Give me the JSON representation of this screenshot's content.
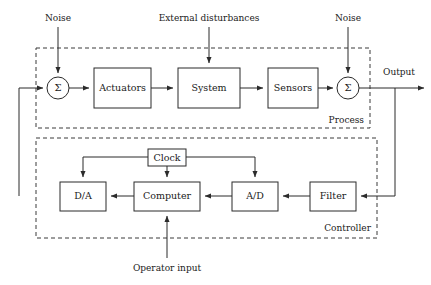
{
  "diagram": {
    "background_color": "#ffffff",
    "line_color": "#2b2b2b",
    "dash_color": "#3a3a3a",
    "text_color": "#1a1a1a"
  },
  "blocks": [
    {
      "id": "actuators",
      "label": "Actuators",
      "x": 94,
      "y": 68,
      "w": 57,
      "h": 40
    },
    {
      "id": "system",
      "label": "System",
      "x": 178,
      "y": 68,
      "w": 62,
      "h": 40
    },
    {
      "id": "sensors",
      "label": "Sensors",
      "x": 268,
      "y": 68,
      "w": 50,
      "h": 40
    },
    {
      "id": "clock",
      "label": "Clock",
      "x": 148,
      "y": 149,
      "w": 38,
      "h": 17
    },
    {
      "id": "da",
      "label": "D/A",
      "x": 60,
      "y": 182,
      "w": 46,
      "h": 29
    },
    {
      "id": "computer",
      "label": "Computer",
      "x": 134,
      "y": 182,
      "w": 66,
      "h": 29
    },
    {
      "id": "ad",
      "label": "A/D",
      "x": 232,
      "y": 182,
      "w": 46,
      "h": 29
    },
    {
      "id": "filter",
      "label": "Filter",
      "x": 310,
      "y": 182,
      "w": 46,
      "h": 29
    }
  ],
  "summing_junctions": [
    {
      "id": "sum-left",
      "glyph": "Σ",
      "cx": 58,
      "cy": 88,
      "r": 11
    },
    {
      "id": "sum-right",
      "glyph": "Σ",
      "cx": 348,
      "cy": 88,
      "r": 11
    }
  ],
  "group_boxes": [
    {
      "id": "process",
      "label": "Process",
      "x": 36,
      "y": 48,
      "w": 334,
      "h": 80,
      "label_x": 364,
      "label_y": 120
    },
    {
      "id": "controller",
      "label": "Controller",
      "x": 36,
      "y": 138,
      "w": 341,
      "h": 100,
      "label_x": 371,
      "label_y": 228
    }
  ],
  "annotations": [
    {
      "id": "noise-left",
      "label": "Noise",
      "x": 58,
      "y": 18
    },
    {
      "id": "external-disturbances",
      "label": "External disturbances",
      "x": 209,
      "y": 18
    },
    {
      "id": "noise-right",
      "label": "Noise",
      "x": 348,
      "y": 18
    },
    {
      "id": "operator-input",
      "label": "Operator input",
      "x": 167,
      "y": 268
    },
    {
      "id": "output",
      "label": "Output",
      "x": 383,
      "y": 72
    }
  ],
  "signal_paths": [
    {
      "id": "path-noise-left-to-sum",
      "from": "noise-left",
      "to": "sum-left"
    },
    {
      "id": "path-sum-left-to-actuators",
      "from": "sum-left",
      "to": "actuators"
    },
    {
      "id": "path-actuators-to-system",
      "from": "actuators",
      "to": "system"
    },
    {
      "id": "path-disturbance-to-system",
      "from": "external-disturbances",
      "to": "system"
    },
    {
      "id": "path-system-to-sensors",
      "from": "system",
      "to": "sensors"
    },
    {
      "id": "path-sensors-to-sum-right",
      "from": "sensors",
      "to": "sum-right"
    },
    {
      "id": "path-noise-right-to-sum-right",
      "from": "noise-right",
      "to": "sum-right"
    },
    {
      "id": "path-sum-right-to-output",
      "from": "sum-right",
      "to": "output"
    },
    {
      "id": "path-output-to-filter",
      "from": "output",
      "to": "filter"
    },
    {
      "id": "path-filter-to-ad",
      "from": "filter",
      "to": "ad"
    },
    {
      "id": "path-ad-to-computer",
      "from": "ad",
      "to": "computer"
    },
    {
      "id": "path-computer-to-da",
      "from": "computer",
      "to": "da"
    },
    {
      "id": "path-da-to-sum-left",
      "from": "da",
      "to": "sum-left"
    },
    {
      "id": "path-clock-to-da",
      "from": "clock",
      "to": "da"
    },
    {
      "id": "path-clock-to-computer",
      "from": "clock",
      "to": "computer"
    },
    {
      "id": "path-clock-to-ad",
      "from": "clock",
      "to": "ad"
    },
    {
      "id": "path-operator-to-computer",
      "from": "operator-input",
      "to": "computer"
    }
  ]
}
